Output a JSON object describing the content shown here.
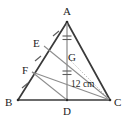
{
  "figure": {
    "type": "geometry-diagram",
    "background_color": "#ffffff",
    "stroke_color": "#3a3a3a",
    "thin_stroke_color": "#8a8a8a",
    "dotted_stroke_color": "#b5b5b5",
    "label_color": "#1c1c1c",
    "vertices": {
      "A": {
        "label": "A",
        "x": 67,
        "y": 22
      },
      "B": {
        "label": "B",
        "x": 18,
        "y": 100
      },
      "C": {
        "label": "C",
        "x": 110,
        "y": 100
      },
      "D": {
        "label": "D",
        "x": 67,
        "y": 100
      },
      "E": {
        "label": "E",
        "x": 44,
        "y": 46
      },
      "F": {
        "label": "F",
        "x": 32,
        "y": 72
      },
      "G": {
        "label": "G",
        "x": 67,
        "y": 57
      }
    },
    "measurements": [
      {
        "label": "12 cm",
        "segment": "GD",
        "x": 71,
        "y": 79
      }
    ],
    "segments": [
      {
        "name": "AB",
        "from": "A",
        "to": "B",
        "style": "solid-thick"
      },
      {
        "name": "AC",
        "from": "A",
        "to": "C",
        "style": "solid-thick"
      },
      {
        "name": "BC",
        "from": "B",
        "to": "C",
        "style": "solid-thick"
      },
      {
        "name": "AD",
        "from": "A",
        "to": "D",
        "style": "solid-thin"
      },
      {
        "name": "EC",
        "from": "E",
        "to": "C",
        "style": "solid-thin"
      },
      {
        "name": "FC",
        "from": "F",
        "to": "C",
        "style": "solid-thin"
      },
      {
        "name": "GC",
        "from": "G",
        "to": "C",
        "style": "dotted"
      },
      {
        "name": "FD",
        "from": "F",
        "to": "D",
        "style": "solid-thin"
      }
    ],
    "tick_marks": [
      {
        "on": "AG",
        "count": 2,
        "orientation": "horizontal"
      },
      {
        "on": "GD",
        "count": 2,
        "orientation": "horizontal"
      },
      {
        "on": "AE",
        "count": 1,
        "orientation": "slash"
      },
      {
        "on": "EF",
        "count": 1,
        "orientation": "slash"
      },
      {
        "on": "FB",
        "count": 1,
        "orientation": "slash"
      }
    ]
  }
}
